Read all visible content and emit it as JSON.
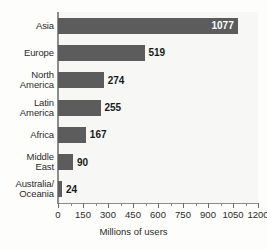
{
  "chart_data": {
    "type": "bar",
    "orientation": "horizontal",
    "title": "",
    "xlabel": "Millions of users",
    "ylabel": "",
    "xlim": [
      0,
      1200
    ],
    "grid": false,
    "legend": null,
    "categories": [
      "Asia",
      "Europe",
      "North\nAmerica",
      "Latin\nAmerica",
      "Africa",
      "Middle\nEast",
      "Australia/\nOceania"
    ],
    "values": [
      1077,
      519,
      274,
      255,
      167,
      90,
      24
    ],
    "data_labels": [
      "1077",
      "519",
      "274",
      "255",
      "167",
      "90",
      "24"
    ],
    "label_placement": [
      "inside",
      "outside",
      "outside",
      "outside",
      "outside",
      "outside",
      "outside"
    ],
    "xticks": [
      0,
      150,
      300,
      450,
      600,
      750,
      900,
      1050,
      1200
    ],
    "xtick_labels": [
      "0",
      "150",
      "300",
      "450",
      "600",
      "750",
      "900",
      "1050",
      "1200"
    ],
    "xticks_minor": [
      75,
      225,
      375,
      525,
      675,
      825,
      975,
      1125
    ],
    "colors": {
      "bar": "#5c5c5c",
      "plot_background": "#f7f7f5",
      "figure_background": "#fdfdfc",
      "axis_line": "#8c8c8c",
      "label_text": "#2b2b2b",
      "value_text_outside": "#1a1a1a",
      "value_text_inside": "#ffffff"
    }
  }
}
